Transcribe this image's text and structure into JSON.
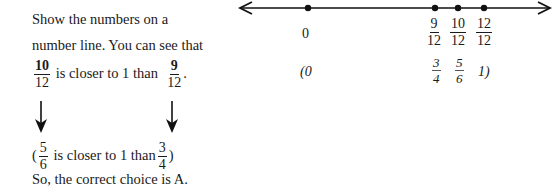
{
  "explanation": {
    "line1": "Show the numbers on a",
    "line2": "number line. You can see that",
    "line3": {
      "frac_a": {
        "num": "10",
        "den": "12"
      },
      "text": "is closer to 1 than",
      "frac_b": {
        "num": "9",
        "den": "12"
      },
      "end": "."
    },
    "line4": {
      "open": "(",
      "frac_a": {
        "num": "5",
        "den": "6"
      },
      "text": "is closer to 1 than",
      "frac_b": {
        "num": "3",
        "den": "4"
      },
      "close": ")"
    },
    "conclusion": "So, the correct choice is A."
  },
  "number_line": {
    "points": [
      {
        "label": "0",
        "x": 308
      },
      {
        "num": "9",
        "den": "12",
        "x": 435
      },
      {
        "num": "10",
        "den": "12",
        "x": 458
      },
      {
        "num": "12",
        "den": "12",
        "x": 484
      }
    ],
    "equivalents": {
      "open": "(0",
      "fracs": [
        {
          "num": "3",
          "den": "4"
        },
        {
          "num": "5",
          "den": "6"
        }
      ],
      "close": "1)"
    }
  }
}
